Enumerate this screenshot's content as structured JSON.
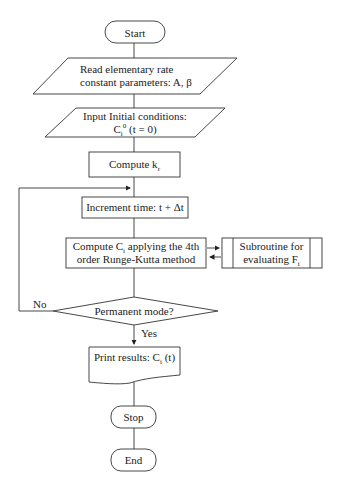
{
  "flowchart": {
    "nodes": [
      {
        "id": "start",
        "shape": "terminator",
        "text": "Start"
      },
      {
        "id": "read_params",
        "shape": "data",
        "lines": [
          "Read elementary rate",
          "constant parameters: A, β"
        ]
      },
      {
        "id": "input_initial",
        "shape": "data",
        "lines": [
          "Input Initial conditions:",
          "C",
          "i",
          "0",
          " (t = 0)"
        ]
      },
      {
        "id": "compute_kr",
        "shape": "process",
        "text": "Compute k",
        "sub": "r"
      },
      {
        "id": "increment_time",
        "shape": "process",
        "text": "Increment time: t + Δt"
      },
      {
        "id": "compute_ci",
        "shape": "process",
        "lines": [
          "Compute C",
          "i",
          " applying the 4th",
          "order Runge-Kutta method"
        ]
      },
      {
        "id": "subroutine",
        "shape": "predefined-process",
        "lines": [
          "Subroutine for",
          "evaluating F",
          "i"
        ]
      },
      {
        "id": "decision",
        "shape": "decision",
        "text": "Permanent mode?"
      },
      {
        "id": "print_results",
        "shape": "document",
        "text": "Print results: C",
        "sub": "i",
        "suffix": " (t)"
      },
      {
        "id": "stop",
        "shape": "terminator",
        "text": "Stop"
      },
      {
        "id": "end",
        "shape": "terminator",
        "text": "End"
      }
    ],
    "edge_labels": {
      "no": "No",
      "yes": "Yes"
    }
  }
}
